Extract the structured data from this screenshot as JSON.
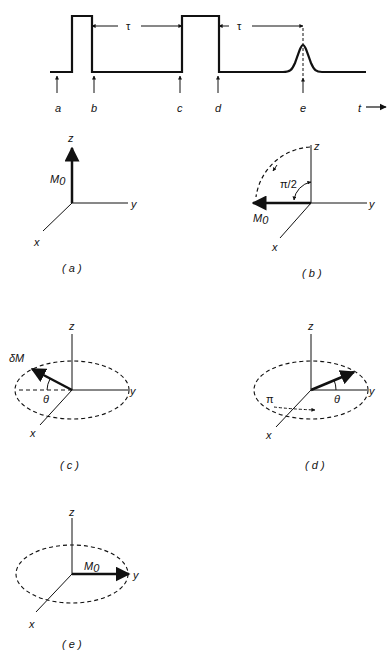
{
  "pulse_sequence": {
    "interval_label_1": "τ",
    "interval_label_2": "τ",
    "markers": [
      "a",
      "b",
      "c",
      "d",
      "e"
    ],
    "time_axis_label": "t"
  },
  "panels": [
    {
      "id": "a",
      "caption": "( a )",
      "axis_x": "x",
      "axis_y": "y",
      "axis_z": "z",
      "vector_label": "M",
      "vector_sub": "0"
    },
    {
      "id": "b",
      "caption": "( b )",
      "axis_x": "x",
      "axis_y": "y",
      "axis_z": "z",
      "vector_label": "M",
      "vector_sub": "0",
      "angle_label": "π/2"
    },
    {
      "id": "c",
      "caption": "( c )",
      "axis_x": "x",
      "axis_y": "y",
      "axis_z": "z",
      "vector_label": "δM",
      "angle_label": "θ"
    },
    {
      "id": "d",
      "caption": "( d )",
      "axis_x": "x",
      "axis_y": "y",
      "axis_z": "z",
      "angle_label": "θ",
      "rotation_label": "π"
    },
    {
      "id": "e",
      "caption": "( e )",
      "axis_x": "x",
      "axis_y": "y",
      "axis_z": "z",
      "vector_label": "M",
      "vector_sub": "0"
    }
  ]
}
